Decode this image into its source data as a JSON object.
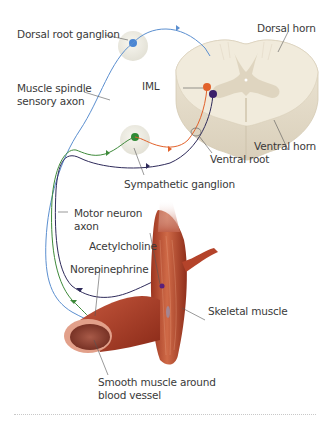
{
  "diagram": {
    "type": "anatomical-illustration",
    "labels": {
      "dorsal_root_ganglion": "Dorsal root ganglion",
      "dorsal_horn": "Dorsal horn",
      "muscle_spindle_sensory_axon": "Muscle spindle\nsensory axon",
      "iml": "IML",
      "ventral_horn": "Ventral horn",
      "ventral_root": "Ventral root",
      "sympathetic_ganglion": "Sympathetic ganglion",
      "motor_neuron_axon": "Motor neuron\naxon",
      "acetylcholine": "Acetylcholine",
      "norepinephrine": "Norepinephrine",
      "skeletal_muscle": "Skeletal muscle",
      "smooth_muscle": "Smooth muscle around\nblood vessel"
    },
    "colors": {
      "sensory_axon": "#5b8fd0",
      "preganglionic_axon": "#e2622b",
      "postganglionic_axon": "#3e8a3a",
      "motor_axon": "#2e2a5a",
      "spinal_cord": "#efe8d8",
      "gray_matter": "#ddd3bd",
      "ganglion": "#ecebe2",
      "muscle": "#b8452c",
      "leader_line": "#555555"
    },
    "nodes": [
      {
        "id": "drg",
        "label": "Dorsal root ganglion",
        "color": "#4a86d4"
      },
      {
        "id": "iml_neuron",
        "label": "IML",
        "color": "#e2622b"
      },
      {
        "id": "motor_neuron",
        "label": "Ventral horn",
        "color": "#3b1f6a"
      },
      {
        "id": "symp_neuron",
        "label": "Sympathetic ganglion",
        "color": "#2f8a35"
      }
    ],
    "edges": [
      {
        "from": "skeletal_muscle",
        "to": "drg",
        "label": "Muscle spindle sensory axon",
        "color": "#5b8fd0"
      },
      {
        "from": "drg",
        "to": "spinal_cord",
        "color": "#5b8fd0"
      },
      {
        "from": "iml_neuron",
        "to": "symp_neuron",
        "via": "Ventral root",
        "color": "#e2622b"
      },
      {
        "from": "symp_neuron",
        "to": "smooth_muscle",
        "label": "Norepinephrine",
        "color": "#3e8a3a"
      },
      {
        "from": "motor_neuron",
        "to": "skeletal_muscle",
        "label": "Acetylcholine",
        "color": "#2e2a5a"
      }
    ]
  }
}
